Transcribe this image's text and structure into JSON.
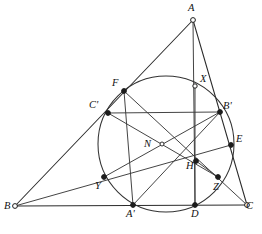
{
  "figure": {
    "width": 262,
    "height": 234,
    "background_color": "#ffffff",
    "stroke_color": "#2b2b2b",
    "label_color": "#111111"
  },
  "labels": {
    "A": "A",
    "B": "B",
    "C": "C",
    "A_prime": "A'",
    "B_prime": "B'",
    "C_prime": "C'",
    "D": "D",
    "E": "E",
    "F": "F",
    "X": "X",
    "Y": "Y",
    "Z": "Z",
    "H": "H",
    "N": "N"
  },
  "label_positions": {
    "A": {
      "x": 188,
      "y": 3
    },
    "B": {
      "x": 4,
      "y": 201
    },
    "C": {
      "x": 246,
      "y": 201
    },
    "A_prime": {
      "x": 126,
      "y": 209
    },
    "B_prime": {
      "x": 223,
      "y": 101
    },
    "C_prime": {
      "x": 89,
      "y": 100
    },
    "D": {
      "x": 191,
      "y": 209
    },
    "E": {
      "x": 236,
      "y": 134
    },
    "F": {
      "x": 112,
      "y": 78
    },
    "X": {
      "x": 200,
      "y": 74
    },
    "Y": {
      "x": 95,
      "y": 181
    },
    "Z": {
      "x": 213,
      "y": 182
    },
    "H": {
      "x": 186,
      "y": 161
    },
    "N": {
      "x": 144,
      "y": 139
    }
  },
  "points": [
    {
      "name": "A",
      "label": "A",
      "x": 193,
      "y": 20,
      "marker": "open",
      "radius": 2.4,
      "role": "triangle-vertex"
    },
    {
      "name": "B",
      "label": "B",
      "x": 15,
      "y": 206,
      "marker": "open",
      "radius": 2.4,
      "role": "triangle-vertex"
    },
    {
      "name": "C",
      "label": "C",
      "x": 247,
      "y": 205,
      "marker": "open",
      "radius": 2.4,
      "role": "triangle-vertex"
    },
    {
      "name": "A_prime",
      "label": "A'",
      "x": 133,
      "y": 205,
      "marker": "solid",
      "radius": 2.4,
      "role": "side-midpoint"
    },
    {
      "name": "B_prime",
      "label": "B'",
      "x": 220,
      "y": 112,
      "marker": "solid",
      "radius": 2.4,
      "role": "side-midpoint"
    },
    {
      "name": "C_prime",
      "label": "C'",
      "x": 108,
      "y": 113,
      "marker": "solid",
      "radius": 2.4,
      "role": "side-midpoint"
    },
    {
      "name": "D",
      "label": "D",
      "x": 195,
      "y": 205,
      "marker": "solid",
      "radius": 2.4,
      "role": "altitude-foot"
    },
    {
      "name": "E",
      "label": "E",
      "x": 231,
      "y": 145,
      "marker": "solid",
      "radius": 2.4,
      "role": "altitude-foot"
    },
    {
      "name": "F",
      "label": "F",
      "x": 124,
      "y": 91,
      "marker": "solid",
      "radius": 2.4,
      "role": "altitude-foot"
    },
    {
      "name": "X",
      "label": "X",
      "x": 195,
      "y": 86,
      "marker": "open",
      "radius": 2.2,
      "role": "euler-point"
    },
    {
      "name": "Y",
      "label": "Y",
      "x": 104,
      "y": 177,
      "marker": "solid",
      "radius": 2.4,
      "role": "euler-point"
    },
    {
      "name": "Z",
      "label": "Z",
      "x": 218,
      "y": 177,
      "marker": "solid",
      "radius": 2.4,
      "role": "euler-point"
    },
    {
      "name": "H",
      "label": "H",
      "x": 196,
      "y": 161,
      "marker": "solid",
      "radius": 2.4,
      "role": "orthocenter"
    },
    {
      "name": "N",
      "label": "N",
      "x": 162,
      "y": 144,
      "marker": "open",
      "radius": 2.0,
      "role": "nine-point-center"
    }
  ],
  "circle": {
    "name": "nine-point-circle",
    "cx": 166,
    "cy": 144,
    "r": 68,
    "stroke": "#333333"
  },
  "segments": [
    {
      "name": "side-AB",
      "kind": "edge",
      "from": "A",
      "to": "B"
    },
    {
      "name": "side-BC",
      "kind": "edge",
      "from": "B",
      "to": "C"
    },
    {
      "name": "side-CA",
      "kind": "edge",
      "from": "C",
      "to": "A"
    },
    {
      "name": "altitude-A-D",
      "kind": "cevian",
      "from": "A",
      "to": "D"
    },
    {
      "name": "altitude-B-E",
      "kind": "cevian",
      "from": "B",
      "to": "E"
    },
    {
      "name": "altitude-C-F",
      "kind": "cevian",
      "from": "C",
      "to": "F"
    },
    {
      "name": "midline-Cp-Bp",
      "kind": "chord",
      "from": "C_prime",
      "to": "B_prime"
    },
    {
      "name": "chord-F-Ap",
      "kind": "chord",
      "from": "F",
      "to": "A_prime"
    },
    {
      "name": "chord-Cp-Z",
      "kind": "chord",
      "from": "C_prime",
      "to": "Z"
    },
    {
      "name": "chord-Ap-Bp",
      "kind": "chord",
      "from": "A_prime",
      "to": "B_prime"
    },
    {
      "name": "chord-Y-Bp",
      "kind": "chord",
      "from": "Y",
      "to": "B_prime"
    },
    {
      "name": "chord-X-D",
      "kind": "chord",
      "from": "X",
      "to": "D"
    },
    {
      "name": "chord-H-Z",
      "kind": "chord",
      "from": "H",
      "to": "Z"
    }
  ]
}
